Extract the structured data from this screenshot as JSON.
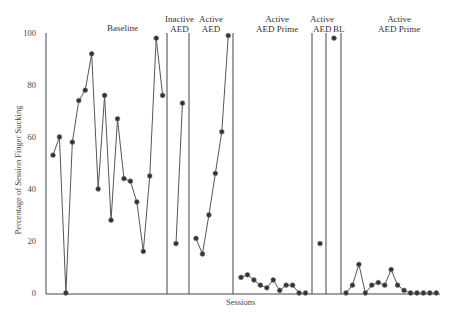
{
  "chart_data": {
    "type": "line",
    "title": "",
    "xlabel": "Sessions",
    "ylabel": "Percentage of Session Finger Sucking",
    "ylim": [
      0,
      100
    ],
    "yticks": [
      0,
      20,
      40,
      60,
      80,
      100
    ],
    "grid": false,
    "legend": null,
    "phases": [
      {
        "label": "Baseline",
        "label_lines": [
          "Baseline"
        ],
        "values": [
          53,
          60,
          0,
          58,
          74,
          78,
          92,
          40,
          76,
          28,
          67,
          44,
          43,
          35,
          16,
          45,
          98,
          76
        ]
      },
      {
        "label": "Inactive AED",
        "label_lines": [
          "Inactive",
          "AED"
        ],
        "values": [
          19,
          73
        ]
      },
      {
        "label": "Active AED",
        "label_lines": [
          "Active",
          "AED"
        ],
        "values": [
          21,
          15,
          30,
          46,
          62,
          99
        ]
      },
      {
        "label": "Active AED Prime",
        "label_lines": [
          "Active",
          "AED Prime"
        ],
        "values": [
          6,
          7,
          5,
          3,
          2,
          5,
          1,
          3,
          3,
          0,
          0
        ]
      },
      {
        "label": "Active AED",
        "label_lines": [
          "Active",
          "AED"
        ],
        "values": [
          19
        ]
      },
      {
        "label": "BL",
        "label_lines": [
          "BL"
        ],
        "values": [
          98
        ]
      },
      {
        "label": "Active AED Prime",
        "label_lines": [
          "Active",
          "AED Prime"
        ],
        "values": [
          0,
          3,
          11,
          0,
          3,
          4,
          3,
          9,
          3,
          1,
          0,
          0,
          0,
          0,
          0
        ]
      }
    ]
  },
  "labels": {
    "xlabel": "Sessions",
    "ylabel": "Percentage of Session Finger Sucking",
    "ticks": [
      "0",
      "20",
      "40",
      "60",
      "80",
      "100"
    ],
    "phase1": "Baseline",
    "phase2_l1": "Inactive",
    "phase2_l2": "AED",
    "phase3_l1": "Active",
    "phase3_l2": "AED",
    "phase4_l1": "Active",
    "phase4_l2": "AED Prime",
    "phase5_l1": "Active",
    "phase5_l2": "AED",
    "phase6": "BL",
    "phase7_l1": "Active",
    "phase7_l2": "AED Prime"
  },
  "colors": {
    "line": "#555555",
    "marker": "#333333",
    "axis": "#444444"
  }
}
